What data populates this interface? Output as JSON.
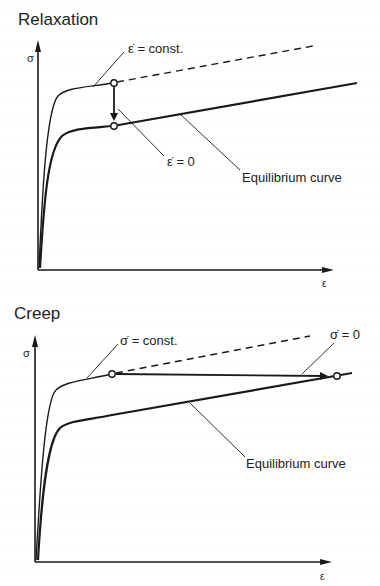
{
  "relaxation": {
    "title": "Relaxation",
    "y_axis_label": "σ",
    "x_axis_label": "ε",
    "label_strain_rate_const": "ε̇ = const.",
    "label_strain_rate_zero": "ε̇ = 0",
    "label_equilibrium": "Equilibrium curve"
  },
  "creep": {
    "title": "Creep",
    "y_axis_label": "σ",
    "x_axis_label": "ε",
    "label_stress_rate_const": "σ̇ = const.",
    "label_stress_rate_zero": "σ̇ = 0",
    "label_equilibrium": "Equilibrium curve"
  },
  "colors": {
    "line": "#1a1a1a",
    "background": "#ffffff"
  }
}
